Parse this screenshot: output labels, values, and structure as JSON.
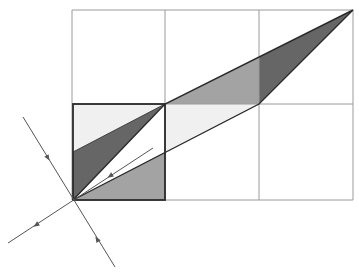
{
  "diagram": {
    "colors": {
      "background": "#ffffff",
      "grid": "#9a9a9a",
      "bold_outline": "#2a2a2a",
      "dark_fill": "#666666",
      "medium_fill": "#a3a3a3",
      "light_fill": "#f0f0f0",
      "line": "#555555"
    },
    "grid": {
      "columns_x": [
        72,
        165,
        259,
        353
      ],
      "rows_y": [
        10,
        104,
        200
      ]
    },
    "unit_square": {
      "x": 73,
      "y": 104,
      "w": 92,
      "h": 96
    },
    "parallelogram": [
      [
        73,
        200
      ],
      [
        165,
        104
      ],
      [
        353,
        10
      ],
      [
        259,
        104
      ]
    ],
    "regions": [
      {
        "name": "square-light-triangle",
        "fill": "light_fill",
        "points": [
          [
            73,
            104
          ],
          [
            165,
            104
          ],
          [
            73,
            152
          ]
        ]
      },
      {
        "name": "square-dark-triangle",
        "fill": "dark_fill",
        "points": [
          [
            73,
            152
          ],
          [
            165,
            104
          ],
          [
            73,
            200
          ]
        ]
      },
      {
        "name": "square-medium-triangle",
        "fill": "medium_fill",
        "points": [
          [
            73,
            200
          ],
          [
            165,
            152
          ],
          [
            165,
            200
          ]
        ]
      },
      {
        "name": "upper-medium-triangle",
        "fill": "medium_fill",
        "points": [
          [
            165,
            104
          ],
          [
            259,
            57
          ],
          [
            259,
            104
          ]
        ]
      },
      {
        "name": "upper-dark-triangle",
        "fill": "dark_fill",
        "points": [
          [
            259,
            57
          ],
          [
            353,
            10
          ],
          [
            259,
            104
          ]
        ]
      },
      {
        "name": "middle-light-triangle",
        "fill": "light_fill",
        "points": [
          [
            165,
            104
          ],
          [
            259,
            104
          ],
          [
            165,
            152
          ]
        ]
      }
    ],
    "lines": [
      {
        "name": "steep-line",
        "from": [
          23,
          117
        ],
        "to": [
          115,
          267
        ]
      },
      {
        "name": "shallow-line",
        "from": [
          8,
          243
        ],
        "to": [
          153,
          148
        ]
      }
    ],
    "arrows": [
      {
        "name": "arrow-upper-left",
        "at": [
          48,
          158
        ],
        "dir": [
          0.52,
          0.85
        ]
      },
      {
        "name": "arrow-lower-right",
        "at": [
          97,
          239
        ],
        "dir": [
          -0.53,
          -0.85
        ]
      },
      {
        "name": "arrow-lower-left",
        "at": [
          36,
          225
        ],
        "dir": [
          -0.84,
          0.55
        ]
      },
      {
        "name": "arrow-inner",
        "at": [
          110,
          176
        ],
        "dir": [
          -0.84,
          0.55
        ]
      }
    ]
  }
}
